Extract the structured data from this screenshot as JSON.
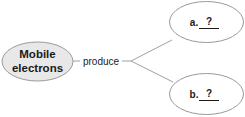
{
  "diagram": {
    "type": "concept-map",
    "colors": {
      "background": "#ffffff",
      "source_fill": "#e8e8e8",
      "target_fill": "#ffffff",
      "stroke": "#9a9a9a",
      "line": "#a0a0a0",
      "text": "#1a1a1a"
    },
    "source_node": {
      "line1": "Mobile",
      "line2": "electrons"
    },
    "link_label": "produce",
    "targets": [
      {
        "label": "a.",
        "blank": "?"
      },
      {
        "label": "b.",
        "blank": "?"
      }
    ]
  }
}
